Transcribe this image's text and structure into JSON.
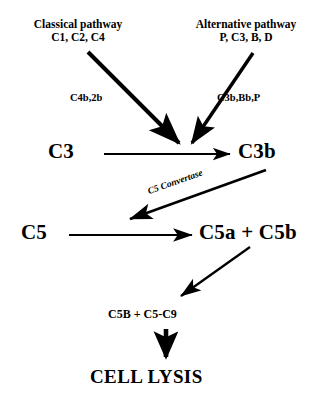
{
  "diagram": {
    "background_color": "#ffffff",
    "ink_color": "#000000",
    "inputs": [
      {
        "id": "classical",
        "title": "Classical pathway",
        "components": "C1, C2, C4",
        "enzyme_label": "C4b,2b"
      },
      {
        "id": "alternative",
        "title": "Alternative pathway",
        "components": "P, C3, B, D",
        "enzyme_label": "C3b,Bb,P"
      }
    ],
    "nodes": {
      "c3": "C3",
      "c3b": "C3b",
      "c5": "C5",
      "c5a_c5b": "C5a + C5b",
      "mac": "C5B + C5-C9",
      "outcome": "CELL LYSIS"
    },
    "edge_labels": {
      "c5_convertase": "C5 Convertase"
    }
  }
}
